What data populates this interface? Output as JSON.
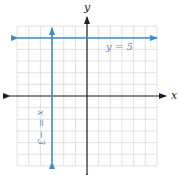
{
  "diagram": {
    "type": "coordinate-plane",
    "x_axis_label": "x",
    "y_axis_label": "y",
    "grid": {
      "x_min": -6,
      "x_max": 6,
      "y_min": -6,
      "y_max": 6,
      "step": 1
    },
    "lines": [
      {
        "id": "horizontal",
        "equation": "y = 5",
        "label": "y = 5",
        "orientation": "horizontal",
        "value": 5
      },
      {
        "id": "vertical",
        "equation": "x = -3",
        "label": "x = −3",
        "orientation": "vertical",
        "value": -3
      }
    ],
    "colors": {
      "line": "#3b8fd1",
      "axis": "#222222",
      "grid": "#d9d9d9",
      "label": "#5a8fc4"
    }
  }
}
